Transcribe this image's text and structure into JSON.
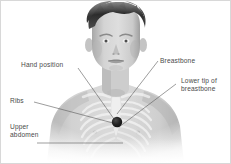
{
  "figure": {
    "border_color": "#d8d8d8",
    "background_color": "#ffffff",
    "label_color": "#4a4a4a",
    "leader_line_color": "#5a5a5a",
    "marker_color": "#1c1c1c",
    "photo": {
      "subject": "young boy, bare chest, grayscale photograph",
      "overlay": "translucent white skeleton overlay of rib cage and breastbone"
    }
  },
  "labels": [
    {
      "id": "hand-position",
      "text": "Hand position"
    },
    {
      "id": "ribs",
      "text": "Ribs"
    },
    {
      "id": "upper-abdomen",
      "text": "Upper\nabdomen"
    },
    {
      "id": "breastbone",
      "text": "Breastbone"
    },
    {
      "id": "lower-tip-of-breastbone",
      "text": "Lower tip of\nbreastbone"
    }
  ]
}
